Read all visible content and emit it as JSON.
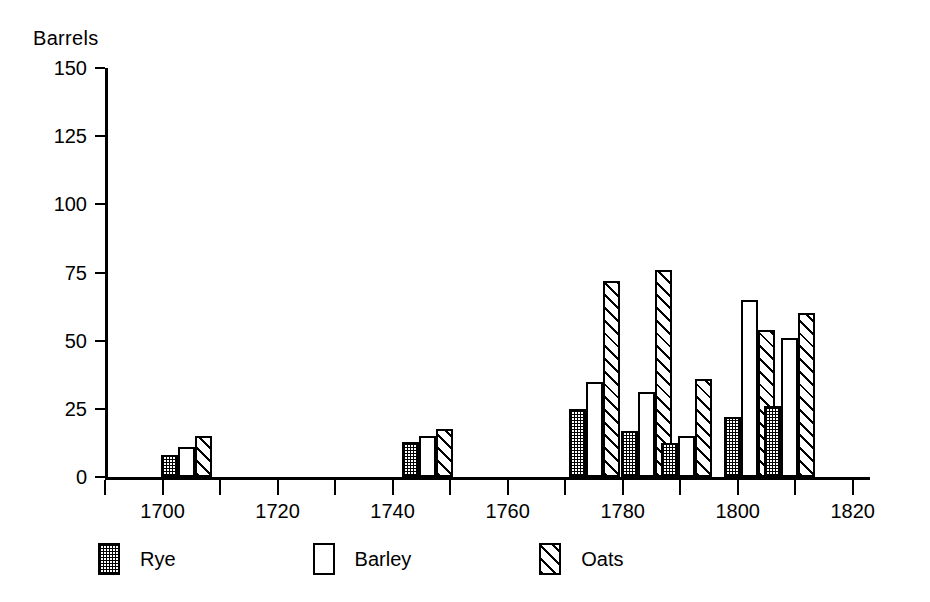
{
  "chart_data": {
    "type": "bar",
    "title": "",
    "subtitle": "",
    "xlabel": "",
    "ylabel": "Barrels",
    "xlim": [
      1690,
      1823
    ],
    "ylim": [
      0,
      150
    ],
    "grid": false,
    "legend_position": "bottom-left",
    "yticks": [
      0,
      25,
      50,
      75,
      100,
      125,
      150
    ],
    "ytick_labels": [
      "0",
      "25",
      "50",
      "75",
      "100",
      "125",
      "150"
    ],
    "xticks_major": [
      1700,
      1720,
      1740,
      1760,
      1780,
      1800,
      1820
    ],
    "xtick_labels": [
      "1700",
      "1720",
      "1740",
      "1760",
      "1780",
      "1800",
      "1820"
    ],
    "xticks_minor": [
      1690,
      1710,
      1730,
      1750,
      1770,
      1790,
      1810
    ],
    "series": [
      {
        "name": "Rye",
        "pattern": "stipple",
        "values": [
          8,
          13,
          25,
          17,
          12.5,
          22,
          26
        ]
      },
      {
        "name": "Barley",
        "pattern": "open",
        "values": [
          11,
          15,
          35,
          31,
          15,
          65,
          51
        ]
      },
      {
        "name": "Oats",
        "pattern": "diagonal-hatch",
        "values": [
          15,
          17.5,
          72,
          76,
          36,
          54,
          60
        ]
      }
    ],
    "groups": [
      {
        "year": 1700,
        "rye": 8,
        "barley": 11,
        "oats": 15
      },
      {
        "year": 1742,
        "rye": 13,
        "barley": 15,
        "oats": 17.5
      },
      {
        "year": 1771,
        "rye": 25,
        "barley": 35,
        "oats": 72
      },
      {
        "year": 1780,
        "rye": 17,
        "barley": 31,
        "oats": 76
      },
      {
        "year": 1787,
        "rye": 12.5,
        "barley": 15,
        "oats": 36
      },
      {
        "year": 1798,
        "rye": 22,
        "barley": 65,
        "oats": 54
      },
      {
        "year": 1805,
        "rye": 26,
        "barley": 51,
        "oats": 60
      }
    ]
  },
  "legend": {
    "items": [
      {
        "label": "Rye"
      },
      {
        "label": "Barley"
      },
      {
        "label": "Oats"
      }
    ]
  }
}
